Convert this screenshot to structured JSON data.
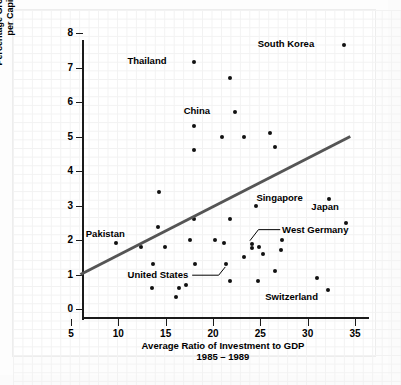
{
  "chart_data": {
    "type": "scatter",
    "title": "",
    "xlabel": "Average Ratio of Investment to GDP\n1985 – 1989",
    "ylabel": "Percentage Growth Rate of Real GDP\nper Capita, 1985 – 1995",
    "xlim": [
      5,
      35
    ],
    "ylim": [
      0,
      8
    ],
    "xticks": [
      5,
      10,
      15,
      20,
      25,
      30,
      35
    ],
    "yticks": [
      0,
      1,
      2,
      3,
      4,
      5,
      6,
      7,
      8
    ],
    "grid": true,
    "legend": "none",
    "trend_line": {
      "name": "regression-line",
      "x0": 6.0,
      "y0": 1.0,
      "x1": 34.5,
      "y1": 5.0,
      "color": "#555555",
      "width": 3
    },
    "point_color": "#111111",
    "points": [
      {
        "x": 33.8,
        "y": 7.65,
        "label": "South Korea"
      },
      {
        "x": 18.0,
        "y": 7.15,
        "label": "Thailand"
      },
      {
        "x": 21.8,
        "y": 6.7,
        "label": ""
      },
      {
        "x": 22.3,
        "y": 5.7,
        "label": "China"
      },
      {
        "x": 18.0,
        "y": 5.3,
        "label": ""
      },
      {
        "x": 26.0,
        "y": 5.1,
        "label": ""
      },
      {
        "x": 21.0,
        "y": 5.0,
        "label": ""
      },
      {
        "x": 23.3,
        "y": 5.0,
        "label": ""
      },
      {
        "x": 26.6,
        "y": 4.7,
        "label": ""
      },
      {
        "x": 18.0,
        "y": 4.6,
        "label": ""
      },
      {
        "x": 14.3,
        "y": 3.4,
        "label": ""
      },
      {
        "x": 32.3,
        "y": 3.2,
        "label": "Singapore"
      },
      {
        "x": 24.5,
        "y": 3.0,
        "label": ""
      },
      {
        "x": 18.0,
        "y": 2.6,
        "label": ""
      },
      {
        "x": 21.8,
        "y": 2.6,
        "label": ""
      },
      {
        "x": 34.0,
        "y": 2.48,
        "label": "Japan"
      },
      {
        "x": 14.2,
        "y": 2.38,
        "label": ""
      },
      {
        "x": 27.3,
        "y": 2.0,
        "label": ""
      },
      {
        "x": 17.6,
        "y": 2.0,
        "label": ""
      },
      {
        "x": 20.2,
        "y": 2.0,
        "label": ""
      },
      {
        "x": 9.8,
        "y": 1.9,
        "label": "Pakistan"
      },
      {
        "x": 21.2,
        "y": 1.9,
        "label": ""
      },
      {
        "x": 24.1,
        "y": 1.87,
        "label": "West Germany"
      },
      {
        "x": 24.1,
        "y": 1.78,
        "label": ""
      },
      {
        "x": 24.9,
        "y": 1.8,
        "label": ""
      },
      {
        "x": 12.4,
        "y": 1.8,
        "label": ""
      },
      {
        "x": 14.9,
        "y": 1.8,
        "label": ""
      },
      {
        "x": 27.2,
        "y": 1.7,
        "label": ""
      },
      {
        "x": 25.3,
        "y": 1.6,
        "label": ""
      },
      {
        "x": 23.3,
        "y": 1.5,
        "label": ""
      },
      {
        "x": 13.7,
        "y": 1.3,
        "label": ""
      },
      {
        "x": 18.1,
        "y": 1.3,
        "label": ""
      },
      {
        "x": 21.4,
        "y": 1.3,
        "label": "United States"
      },
      {
        "x": 26.5,
        "y": 1.1,
        "label": ""
      },
      {
        "x": 31.0,
        "y": 0.9,
        "label": ""
      },
      {
        "x": 21.8,
        "y": 0.8,
        "label": ""
      },
      {
        "x": 24.8,
        "y": 0.8,
        "label": ""
      },
      {
        "x": 17.1,
        "y": 0.7,
        "label": ""
      },
      {
        "x": 13.6,
        "y": 0.6,
        "label": ""
      },
      {
        "x": 16.4,
        "y": 0.6,
        "label": ""
      },
      {
        "x": 32.1,
        "y": 0.55,
        "label": "Switzerland"
      },
      {
        "x": 16.1,
        "y": 0.35,
        "label": ""
      }
    ],
    "annotations": [
      {
        "name": "south-korea",
        "text": "South Korea",
        "lx": 30.9,
        "ly": 7.68,
        "anchor": "right",
        "leader": false
      },
      {
        "name": "thailand",
        "text": "Thailand",
        "lx": 15.3,
        "ly": 7.18,
        "anchor": "right",
        "leader": false
      },
      {
        "name": "china",
        "text": "China",
        "lx": 19.9,
        "ly": 5.73,
        "anchor": "right",
        "leader": false
      },
      {
        "name": "singapore",
        "text": "Singapore",
        "lx": 29.7,
        "ly": 3.23,
        "anchor": "right",
        "leader": false
      },
      {
        "name": "japan",
        "text": "Japan",
        "lx": 33.5,
        "ly": 2.95,
        "anchor": "right",
        "leader": false
      },
      {
        "name": "pakistan",
        "text": "Pakistan",
        "lx": 10.9,
        "ly": 2.18,
        "anchor": "right",
        "leader": false
      },
      {
        "name": "west-germany",
        "text": "West Germany",
        "lx": 27.3,
        "ly": 2.3,
        "anchor": "left",
        "leader": true,
        "path": [
          [
            27.1,
            2.3
          ],
          [
            24.8,
            2.3
          ],
          [
            23.9,
            1.98
          ]
        ]
      },
      {
        "name": "united-states",
        "text": "United States",
        "lx": 17.6,
        "ly": 0.98,
        "anchor": "right",
        "leader": true,
        "path": [
          [
            17.8,
            0.98
          ],
          [
            20.6,
            0.98
          ],
          [
            21.3,
            1.22
          ]
        ]
      },
      {
        "name": "switzerland",
        "text": "Switzerland",
        "lx": 31.3,
        "ly": 0.36,
        "anchor": "right",
        "leader": false
      }
    ]
  }
}
